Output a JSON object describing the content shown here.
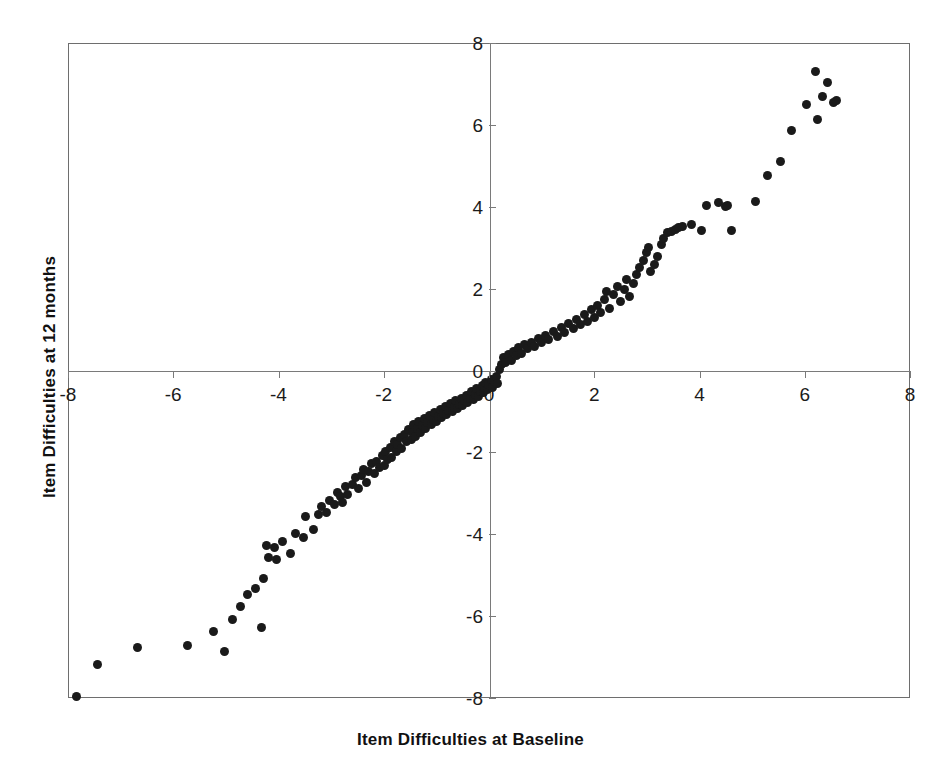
{
  "figure": {
    "background_color": "#ffffff",
    "frame_color": "#6e6e6e",
    "point_color": "#1a1a1a"
  },
  "chart_data": {
    "type": "scatter",
    "title": "",
    "xlabel": "Item Difficulties at Baseline",
    "ylabel": "Item Difficulties at 12 months",
    "xlim": [
      -8,
      8
    ],
    "ylim": [
      -8,
      8
    ],
    "xticks": [
      -8,
      -6,
      -4,
      -2,
      0,
      2,
      4,
      6,
      8
    ],
    "yticks": [
      -8,
      -6,
      -4,
      -2,
      0,
      2,
      4,
      6,
      8
    ],
    "xticklabels": [
      "-8",
      "-6",
      "-4",
      "-2",
      "0",
      "2",
      "4",
      "6",
      "8"
    ],
    "yticklabels": [
      "-8",
      "-6",
      "-4",
      "-2",
      "0",
      "2",
      "4",
      "6",
      "8"
    ],
    "grid": false,
    "legend": null,
    "marker": "filled-circle",
    "marker_size": 9,
    "series": [
      {
        "name": "Item difficulties",
        "points": [
          [
            -7.85,
            -7.95
          ],
          [
            -7.45,
            -7.15
          ],
          [
            -6.7,
            -6.75
          ],
          [
            -5.75,
            -6.7
          ],
          [
            -5.25,
            -6.35
          ],
          [
            -5.05,
            -6.85
          ],
          [
            -4.9,
            -6.05
          ],
          [
            -4.75,
            -5.75
          ],
          [
            -4.6,
            -5.45
          ],
          [
            -4.45,
            -5.3
          ],
          [
            -4.35,
            -6.25
          ],
          [
            -4.3,
            -5.05
          ],
          [
            -4.25,
            -4.25
          ],
          [
            -4.2,
            -4.55
          ],
          [
            -4.1,
            -4.3
          ],
          [
            -4.05,
            -4.6
          ],
          [
            -3.95,
            -4.15
          ],
          [
            -3.8,
            -4.45
          ],
          [
            -3.7,
            -3.95
          ],
          [
            -3.55,
            -4.05
          ],
          [
            -3.5,
            -3.55
          ],
          [
            -3.35,
            -3.85
          ],
          [
            -3.25,
            -3.5
          ],
          [
            -3.2,
            -3.3
          ],
          [
            -3.1,
            -3.45
          ],
          [
            -3.05,
            -3.15
          ],
          [
            -2.95,
            -3.25
          ],
          [
            -2.9,
            -2.95
          ],
          [
            -2.85,
            -3.05
          ],
          [
            -2.8,
            -3.2
          ],
          [
            -2.75,
            -2.8
          ],
          [
            -2.7,
            -3.0
          ],
          [
            -2.62,
            -2.75
          ],
          [
            -2.55,
            -2.6
          ],
          [
            -2.5,
            -2.85
          ],
          [
            -2.45,
            -2.55
          ],
          [
            -2.4,
            -2.4
          ],
          [
            -2.35,
            -2.7
          ],
          [
            -2.3,
            -2.45
          ],
          [
            -2.25,
            -2.25
          ],
          [
            -2.2,
            -2.5
          ],
          [
            -2.15,
            -2.2
          ],
          [
            -2.1,
            -2.35
          ],
          [
            -2.05,
            -2.05
          ],
          [
            -2.0,
            -2.3
          ],
          [
            -1.98,
            -1.95
          ],
          [
            -1.95,
            -2.15
          ],
          [
            -1.9,
            -1.85
          ],
          [
            -1.88,
            -2.1
          ],
          [
            -1.82,
            -1.7
          ],
          [
            -1.78,
            -1.95
          ],
          [
            -1.75,
            -1.78
          ],
          [
            -1.7,
            -1.6
          ],
          [
            -1.68,
            -1.88
          ],
          [
            -1.62,
            -1.55
          ],
          [
            -1.58,
            -1.72
          ],
          [
            -1.55,
            -1.42
          ],
          [
            -1.5,
            -1.65
          ],
          [
            -1.48,
            -1.5
          ],
          [
            -1.45,
            -1.3
          ],
          [
            -1.42,
            -1.58
          ],
          [
            -1.38,
            -1.4
          ],
          [
            -1.35,
            -1.22
          ],
          [
            -1.32,
            -1.48
          ],
          [
            -1.28,
            -1.32
          ],
          [
            -1.25,
            -1.15
          ],
          [
            -1.22,
            -1.4
          ],
          [
            -1.18,
            -1.25
          ],
          [
            -1.15,
            -1.08
          ],
          [
            -1.12,
            -1.3
          ],
          [
            -1.08,
            -1.18
          ],
          [
            -1.05,
            -1.0
          ],
          [
            -1.02,
            -1.22
          ],
          [
            -0.98,
            -1.1
          ],
          [
            -0.95,
            -0.92
          ],
          [
            -0.92,
            -1.12
          ],
          [
            -0.88,
            -1.02
          ],
          [
            -0.85,
            -0.85
          ],
          [
            -0.82,
            -1.05
          ],
          [
            -0.78,
            -0.95
          ],
          [
            -0.75,
            -0.78
          ],
          [
            -0.72,
            -0.98
          ],
          [
            -0.68,
            -0.88
          ],
          [
            -0.65,
            -0.72
          ],
          [
            -0.62,
            -0.9
          ],
          [
            -0.58,
            -0.8
          ],
          [
            -0.55,
            -0.65
          ],
          [
            -0.52,
            -0.82
          ],
          [
            -0.48,
            -0.72
          ],
          [
            -0.45,
            -0.58
          ],
          [
            -0.42,
            -0.75
          ],
          [
            -0.38,
            -0.65
          ],
          [
            -0.35,
            -0.5
          ],
          [
            -0.32,
            -0.68
          ],
          [
            -0.28,
            -0.55
          ],
          [
            -0.25,
            -0.42
          ],
          [
            -0.22,
            -0.6
          ],
          [
            -0.18,
            -0.48
          ],
          [
            -0.15,
            -0.35
          ],
          [
            -0.12,
            -0.52
          ],
          [
            -0.1,
            -0.4
          ],
          [
            -0.08,
            -0.28
          ],
          [
            -0.05,
            -0.45
          ],
          [
            -0.02,
            -0.32
          ],
          [
            0.02,
            -0.2
          ],
          [
            0.05,
            -0.38
          ],
          [
            0.08,
            -0.25
          ],
          [
            0.12,
            -0.12
          ],
          [
            0.15,
            -0.3
          ],
          [
            0.18,
            0.05
          ],
          [
            0.22,
            0.18
          ],
          [
            0.25,
            0.35
          ],
          [
            0.3,
            0.22
          ],
          [
            0.35,
            0.42
          ],
          [
            0.4,
            0.28
          ],
          [
            0.45,
            0.5
          ],
          [
            0.5,
            0.38
          ],
          [
            0.55,
            0.58
          ],
          [
            0.6,
            0.45
          ],
          [
            0.65,
            0.65
          ],
          [
            0.72,
            0.55
          ],
          [
            0.78,
            0.72
          ],
          [
            0.85,
            0.62
          ],
          [
            0.92,
            0.8
          ],
          [
            0.98,
            0.7
          ],
          [
            1.05,
            0.88
          ],
          [
            1.12,
            0.78
          ],
          [
            1.2,
            0.98
          ],
          [
            1.28,
            0.85
          ],
          [
            1.35,
            1.08
          ],
          [
            1.42,
            0.95
          ],
          [
            1.5,
            1.18
          ],
          [
            1.58,
            1.05
          ],
          [
            1.65,
            1.28
          ],
          [
            1.72,
            1.15
          ],
          [
            1.8,
            1.4
          ],
          [
            1.85,
            1.22
          ],
          [
            1.92,
            1.52
          ],
          [
            1.98,
            1.32
          ],
          [
            2.05,
            1.62
          ],
          [
            2.1,
            1.45
          ],
          [
            2.18,
            1.75
          ],
          [
            2.22,
            1.95
          ],
          [
            2.28,
            1.55
          ],
          [
            2.35,
            1.88
          ],
          [
            2.42,
            2.08
          ],
          [
            2.48,
            1.7
          ],
          [
            2.55,
            2.0
          ],
          [
            2.6,
            2.25
          ],
          [
            2.65,
            1.82
          ],
          [
            2.72,
            2.15
          ],
          [
            2.78,
            2.38
          ],
          [
            2.85,
            2.55
          ],
          [
            2.92,
            2.72
          ],
          [
            2.98,
            2.9
          ],
          [
            3.02,
            3.02
          ],
          [
            3.05,
            2.45
          ],
          [
            3.12,
            2.62
          ],
          [
            3.18,
            2.82
          ],
          [
            3.25,
            3.1
          ],
          [
            3.3,
            3.25
          ],
          [
            3.38,
            3.4
          ],
          [
            3.45,
            3.42
          ],
          [
            3.52,
            3.48
          ],
          [
            3.58,
            3.52
          ],
          [
            3.65,
            3.55
          ],
          [
            3.82,
            3.58
          ],
          [
            4.02,
            3.45
          ],
          [
            4.12,
            4.05
          ],
          [
            4.35,
            4.12
          ],
          [
            4.48,
            4.02
          ],
          [
            4.52,
            4.05
          ],
          [
            4.58,
            3.45
          ],
          [
            5.05,
            4.15
          ],
          [
            5.28,
            4.78
          ],
          [
            5.52,
            5.12
          ],
          [
            5.72,
            5.88
          ],
          [
            6.02,
            6.52
          ],
          [
            6.18,
            7.32
          ],
          [
            6.22,
            6.15
          ],
          [
            6.32,
            6.72
          ],
          [
            6.42,
            7.05
          ],
          [
            6.52,
            6.58
          ],
          [
            6.58,
            6.62
          ]
        ]
      }
    ]
  }
}
